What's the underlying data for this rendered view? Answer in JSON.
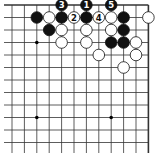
{
  "diagram": {
    "type": "go-board-fragment",
    "columns": 12,
    "rows": 13,
    "origin_x": 12,
    "origin_y": 5,
    "spacing_x": 12.4,
    "spacing_y": 12.5,
    "left_open": true,
    "top_edge": true,
    "right_edge": true,
    "bottom_open": true,
    "star_points": [
      [
        2,
        3
      ],
      [
        8,
        3
      ],
      [
        2,
        9
      ],
      [
        8,
        9
      ]
    ],
    "colors": {
      "black": "#111111",
      "white": "#ffffff",
      "line": "#333333"
    },
    "stones": [
      {
        "col": 4,
        "row": 0,
        "color": "black",
        "label": "3"
      },
      {
        "col": 6,
        "row": 0,
        "color": "black",
        "label": "1"
      },
      {
        "col": 8,
        "row": 0,
        "color": "black",
        "label": "5"
      },
      {
        "col": 2,
        "row": 1,
        "color": "black",
        "label": ""
      },
      {
        "col": 3,
        "row": 1,
        "color": "white",
        "label": ""
      },
      {
        "col": 4,
        "row": 1,
        "color": "black",
        "label": ""
      },
      {
        "col": 5,
        "row": 1,
        "color": "white",
        "label": "2"
      },
      {
        "col": 6,
        "row": 1,
        "color": "black",
        "label": ""
      },
      {
        "col": 7,
        "row": 1,
        "color": "white",
        "label": "4"
      },
      {
        "col": 8,
        "row": 1,
        "color": "white",
        "label": ""
      },
      {
        "col": 9,
        "row": 1,
        "color": "black",
        "label": ""
      },
      {
        "col": 11,
        "row": 1,
        "color": "white",
        "label": ""
      },
      {
        "col": 3,
        "row": 2,
        "color": "black",
        "label": ""
      },
      {
        "col": 4,
        "row": 2,
        "color": "white",
        "label": ""
      },
      {
        "col": 6,
        "row": 2,
        "color": "white",
        "label": ""
      },
      {
        "col": 8,
        "row": 2,
        "color": "white",
        "label": ""
      },
      {
        "col": 9,
        "row": 2,
        "color": "black",
        "label": ""
      },
      {
        "col": 4,
        "row": 3,
        "color": "white",
        "label": ""
      },
      {
        "col": 6,
        "row": 3,
        "color": "white",
        "label": ""
      },
      {
        "col": 8,
        "row": 3,
        "color": "black",
        "label": ""
      },
      {
        "col": 9,
        "row": 3,
        "color": "black",
        "label": ""
      },
      {
        "col": 10,
        "row": 3,
        "color": "white",
        "label": ""
      },
      {
        "col": 7,
        "row": 4,
        "color": "white",
        "label": ""
      },
      {
        "col": 10,
        "row": 4,
        "color": "white",
        "label": ""
      },
      {
        "col": 9,
        "row": 5,
        "color": "white",
        "label": ""
      }
    ]
  }
}
